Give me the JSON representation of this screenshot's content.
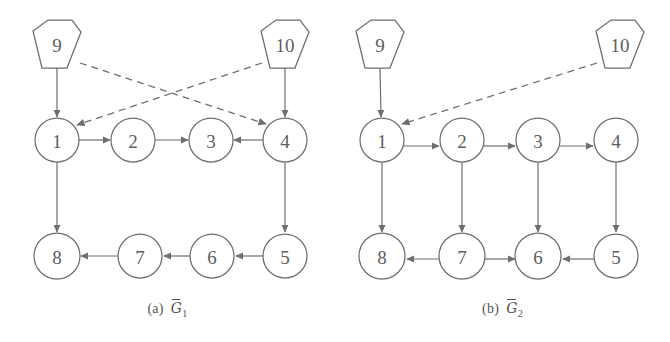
{
  "figure": {
    "background_color": "#ffffff",
    "stroke_color": "#6e6e6e",
    "text_color": "#5d5d5d"
  },
  "panels": [
    {
      "id": "a",
      "caption_tag": "(a)",
      "caption_symbol": "G",
      "caption_subscript": "1",
      "nodes": [
        {
          "id": "n9",
          "label": "9",
          "shape": "hexagon",
          "cx": 57,
          "cy": 45
        },
        {
          "id": "n10",
          "label": "10",
          "shape": "hexagon",
          "cx": 285,
          "cy": 45
        },
        {
          "id": "n1",
          "label": "1",
          "shape": "circle",
          "cx": 57,
          "cy": 140
        },
        {
          "id": "n2",
          "label": "2",
          "shape": "circle",
          "cx": 133,
          "cy": 140
        },
        {
          "id": "n3",
          "label": "3",
          "shape": "circle",
          "cx": 211,
          "cy": 140
        },
        {
          "id": "n4",
          "label": "4",
          "shape": "circle",
          "cx": 285,
          "cy": 140
        },
        {
          "id": "n8",
          "label": "8",
          "shape": "circle",
          "cx": 57,
          "cy": 256
        },
        {
          "id": "n7",
          "label": "7",
          "shape": "circle",
          "cx": 140,
          "cy": 256
        },
        {
          "id": "n6",
          "label": "6",
          "shape": "circle",
          "cx": 212,
          "cy": 256
        },
        {
          "id": "n5",
          "label": "5",
          "shape": "circle",
          "cx": 285,
          "cy": 256
        }
      ],
      "edges": [
        {
          "from": "9",
          "to": "1",
          "style": "solid"
        },
        {
          "from": "10",
          "to": "4",
          "style": "solid"
        },
        {
          "from": "9",
          "to": "4",
          "style": "dashed"
        },
        {
          "from": "10",
          "to": "1",
          "style": "dashed"
        },
        {
          "from": "1",
          "to": "2",
          "style": "solid"
        },
        {
          "from": "2",
          "to": "3",
          "style": "solid"
        },
        {
          "from": "4",
          "to": "3",
          "style": "solid"
        },
        {
          "from": "1",
          "to": "8",
          "style": "solid"
        },
        {
          "from": "4",
          "to": "5",
          "style": "solid"
        },
        {
          "from": "5",
          "to": "6",
          "style": "solid"
        },
        {
          "from": "6",
          "to": "7",
          "style": "solid"
        },
        {
          "from": "7",
          "to": "8",
          "style": "solid"
        }
      ]
    },
    {
      "id": "b",
      "caption_tag": "(b)",
      "caption_symbol": "G",
      "caption_subscript": "2",
      "nodes": [
        {
          "id": "n9",
          "label": "9",
          "shape": "hexagon",
          "cx": 45,
          "cy": 45
        },
        {
          "id": "n10",
          "label": "10",
          "shape": "hexagon",
          "cx": 285,
          "cy": 45
        },
        {
          "id": "n1",
          "label": "1",
          "shape": "circle",
          "cx": 47,
          "cy": 140
        },
        {
          "id": "n2",
          "label": "2",
          "shape": "circle",
          "cx": 127,
          "cy": 140
        },
        {
          "id": "n3",
          "label": "3",
          "shape": "circle",
          "cx": 203,
          "cy": 140
        },
        {
          "id": "n4",
          "label": "4",
          "shape": "circle",
          "cx": 281,
          "cy": 140
        },
        {
          "id": "n8",
          "label": "8",
          "shape": "circle",
          "cx": 47,
          "cy": 256
        },
        {
          "id": "n7",
          "label": "7",
          "shape": "circle",
          "cx": 127,
          "cy": 256
        },
        {
          "id": "n6",
          "label": "6",
          "shape": "circle",
          "cx": 203,
          "cy": 256
        },
        {
          "id": "n5",
          "label": "5",
          "shape": "circle",
          "cx": 281,
          "cy": 256
        }
      ],
      "edges": [
        {
          "from": "9",
          "to": "1",
          "style": "solid"
        },
        {
          "from": "10",
          "to": "1",
          "style": "dashed"
        },
        {
          "from": "1",
          "to": "2",
          "style": "solid"
        },
        {
          "from": "2",
          "to": "3",
          "style": "solid"
        },
        {
          "from": "3",
          "to": "4",
          "style": "solid"
        },
        {
          "from": "1",
          "to": "8",
          "style": "solid"
        },
        {
          "from": "2",
          "to": "7",
          "style": "solid"
        },
        {
          "from": "3",
          "to": "6",
          "style": "solid"
        },
        {
          "from": "4",
          "to": "5",
          "style": "solid"
        },
        {
          "from": "7",
          "to": "8",
          "style": "solid"
        },
        {
          "from": "7",
          "to": "6",
          "style": "solid"
        },
        {
          "from": "5",
          "to": "6",
          "style": "solid"
        }
      ]
    }
  ]
}
